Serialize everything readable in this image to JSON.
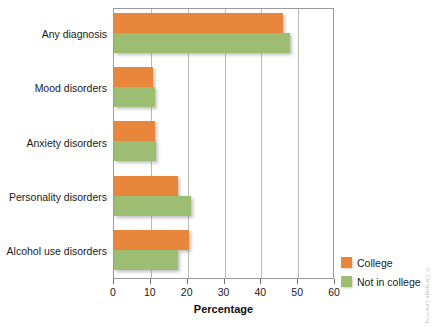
{
  "chart_data": {
    "type": "bar",
    "orientation": "horizontal",
    "title": "",
    "xlabel": "Percentage",
    "ylabel": "",
    "xlim": [
      0,
      60
    ],
    "xticks": [
      0,
      10,
      20,
      30,
      40,
      50,
      60
    ],
    "grid": "vertical",
    "legend_position": "bottom-right",
    "categories": [
      "Any diagnosis",
      "Mood disorders",
      "Anxiety disorders",
      "Personality disorders",
      "Alcohol use disorders"
    ],
    "series": [
      {
        "name": "College",
        "color": "#e8873c",
        "values": [
          45.8,
          10.6,
          11.0,
          17.5,
          20.4
        ]
      },
      {
        "name": "Not in college",
        "color": "#9dbe72",
        "values": [
          47.7,
          11.0,
          11.3,
          21.0,
          17.4
        ]
      }
    ]
  },
  "axis": {
    "x_title": "Percentage",
    "tick_labels": [
      "0",
      "10",
      "20",
      "30",
      "40",
      "50",
      "60"
    ]
  },
  "legend": {
    "items": [
      {
        "label": "College",
        "color": "#e8873c"
      },
      {
        "label": "Not in college",
        "color": "#9dbe72"
      }
    ]
  },
  "credit": {
    "text": "© Cengage Learning"
  },
  "colors": {
    "college": "#e8873c",
    "not_in_college": "#9dbe72",
    "frame": "#9a9a9a",
    "gridline": "#b9b9b9",
    "text": "#1a1a1a"
  }
}
